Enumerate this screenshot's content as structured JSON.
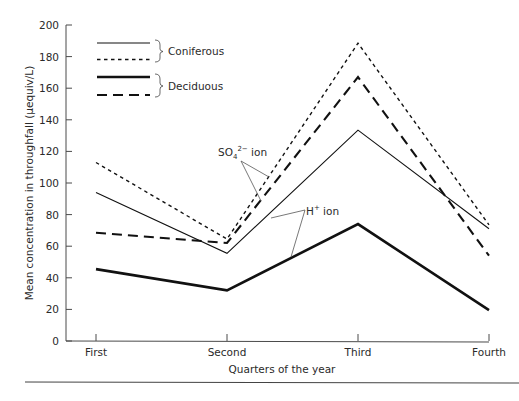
{
  "chart_data": {
    "type": "line",
    "title": "",
    "xlabel": "Quarters of the year",
    "ylabel": "Mean concentration in throughfall (μequiv/L)",
    "categories": [
      "First",
      "Second",
      "Third",
      "Fourth"
    ],
    "ylim": [
      0,
      200
    ],
    "yticks": [
      0,
      20,
      40,
      60,
      80,
      100,
      120,
      140,
      160,
      180,
      200
    ],
    "grid": false,
    "legend_position": "upper-left",
    "series": [
      {
        "name": "Coniferous SO4 2- ion",
        "forest": "Coniferous",
        "ion": "SO4 2-",
        "style": "thin-dotted",
        "values": [
          113,
          64.5,
          188.5,
          73.5
        ]
      },
      {
        "name": "Coniferous H+ ion",
        "forest": "Coniferous",
        "ion": "H+",
        "style": "thin-solid",
        "values": [
          94,
          55.5,
          133.5,
          71
        ]
      },
      {
        "name": "Deciduous SO4 2- ion",
        "forest": "Deciduous",
        "ion": "SO4 2-",
        "style": "thick-dashed",
        "values": [
          68.5,
          62,
          167,
          54
        ]
      },
      {
        "name": "Deciduous H+ ion",
        "forest": "Deciduous",
        "ion": "H+",
        "style": "thick-solid",
        "values": [
          45.5,
          32,
          74,
          19.5
        ]
      }
    ],
    "legend": [
      {
        "group": "Coniferous",
        "styles": [
          "thin-solid",
          "thin-dotted"
        ]
      },
      {
        "group": "Deciduous",
        "styles": [
          "thick-solid",
          "thick-dashed"
        ]
      }
    ],
    "annotations": [
      {
        "text_main": "SO",
        "sub": "4",
        "sup": "2−",
        "suffix": " ion",
        "points_to": [
          "Coniferous SO4 2- ion",
          "Deciduous SO4 2- ion"
        ]
      },
      {
        "text_main": "H",
        "sup": "+",
        "suffix": " ion",
        "points_to": [
          "Coniferous H+ ion",
          "Deciduous H+ ion"
        ]
      }
    ]
  },
  "colors": {
    "line": "#111111",
    "axis": "#4a4a4a",
    "text": "#2a2a2a",
    "background": "#ffffff"
  }
}
